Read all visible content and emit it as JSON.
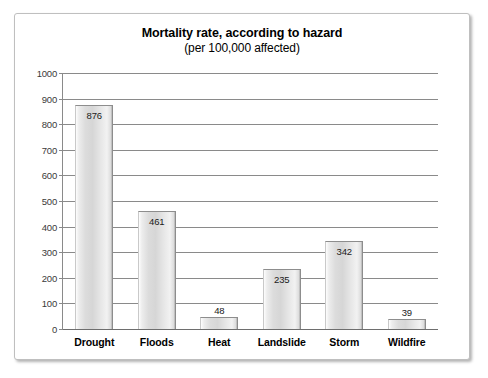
{
  "chart_data": {
    "type": "bar",
    "title": "Mortality rate, according to hazard",
    "subtitle": "(per 100,000 affected)",
    "xlabel": "",
    "ylabel": "",
    "categories": [
      "Drought",
      "Floods",
      "Heat",
      "Landslide",
      "Storm",
      "Wildfire"
    ],
    "values": [
      876,
      461,
      48,
      235,
      342,
      39
    ],
    "value_labels": [
      "876",
      "461",
      "48",
      "235",
      "342",
      "39"
    ],
    "ylim": [
      0,
      1000
    ],
    "ytick_step": 100,
    "ytick_labels": [
      "0",
      "100",
      "200",
      "300",
      "400",
      "500",
      "600",
      "700",
      "800",
      "900",
      "1000"
    ],
    "grid": true,
    "legend": false,
    "legend_position": "none",
    "colors": {
      "bar_fill_light": "#f2f2f2",
      "bar_fill_mid": "#d6d6d6",
      "bar_edge": "#8d8d8d",
      "gridline": "#8a8a8a",
      "text": "#000000",
      "frame_border": "#bfbfbf",
      "background": "#ffffff"
    }
  }
}
